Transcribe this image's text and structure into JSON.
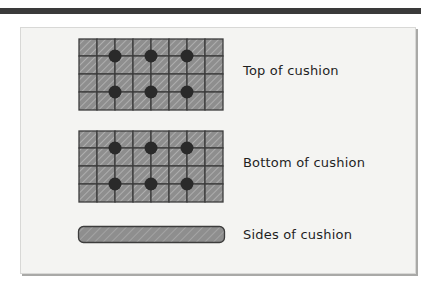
{
  "diagram": {
    "colors": {
      "cell_fill": "#8e8e8e",
      "cell_stroke": "#3c3c3c",
      "hatch": "#c4c4c4",
      "button": "#2a2a2a",
      "panel": "#f4f4f2",
      "top_bar": "#3a3a3a"
    },
    "grid": {
      "columns": 8,
      "rows": 4
    },
    "items": [
      {
        "label": "Top of cushion",
        "kind": "tufted-grid",
        "buttons": 6
      },
      {
        "label": "Bottom of cushion",
        "kind": "tufted-grid",
        "buttons": 6
      },
      {
        "label": "Sides of cushion",
        "kind": "strip"
      }
    ]
  }
}
